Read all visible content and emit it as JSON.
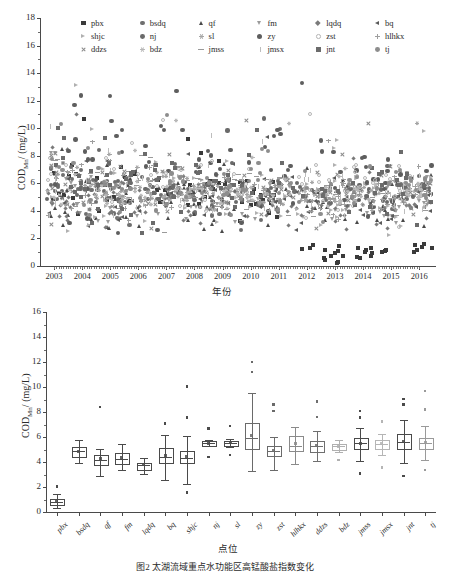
{
  "figure": {
    "caption": "图2  太湖流域重点水功能区高锰酸盐指数变化"
  },
  "chart_data": [
    {
      "id": "scatter-cod-by-year",
      "type": "scatter",
      "title": "",
      "xlabel": "年份",
      "ylabel": "CODMn/ (mg/L)",
      "ylabel_base": "COD",
      "ylabel_sub": "Mn",
      "ylabel_unit": "/ (mg/L)",
      "xlim": [
        2002.5,
        2016.6
      ],
      "ylim": [
        0,
        18
      ],
      "yticks": [
        0,
        2,
        4,
        6,
        8,
        10,
        12,
        14,
        16,
        18
      ],
      "xticks": [
        2003,
        2004,
        2005,
        2006,
        2007,
        2008,
        2009,
        2010,
        2011,
        2012,
        2013,
        2014,
        2015,
        2016
      ],
      "grid": false,
      "legend_position": "top-inside",
      "legend": [
        {
          "label": "pbx",
          "marker": "square",
          "color": "#3a3a3a",
          "size": 4.0
        },
        {
          "label": "bsdq",
          "marker": "circle",
          "color": "#6f6f6f",
          "size": 4.2
        },
        {
          "label": "qf",
          "marker": "triangle-up",
          "color": "#4a4a4a",
          "size": 4.2
        },
        {
          "label": "fm",
          "marker": "triangle-down",
          "color": "#9a9a9a",
          "size": 4.2
        },
        {
          "label": "lqdq",
          "marker": "diamond",
          "color": "#7a7a7a",
          "size": 4.0
        },
        {
          "label": "bq",
          "marker": "triangle-left",
          "color": "#5a5a5a",
          "size": 4.2
        },
        {
          "label": "shjc",
          "marker": "triangle-right",
          "color": "#b0b0b0",
          "size": 4.2
        },
        {
          "label": "nj",
          "marker": "circle",
          "color": "#6a6a6a",
          "size": 4.2
        },
        {
          "label": "sl",
          "marker": "star",
          "color": "#a5a5a5",
          "size": 4.4
        },
        {
          "label": "zy",
          "marker": "circle",
          "color": "#5e5e5e",
          "size": 4.4
        },
        {
          "label": "zst",
          "marker": "circle-open",
          "color": "#b5b5b5",
          "size": 4.0
        },
        {
          "label": "hlhkx",
          "marker": "plus",
          "color": "#9e9e9e",
          "size": 4.6
        },
        {
          "label": "ddzs",
          "marker": "cross",
          "color": "#8a8a8a",
          "size": 4.6
        },
        {
          "label": "bdz",
          "marker": "star",
          "color": "#b8b8b8",
          "size": 4.2
        },
        {
          "label": "jmss",
          "marker": "hline",
          "color": "#9a9a9a",
          "size": 5.0
        },
        {
          "label": "jmsx",
          "marker": "vline",
          "color": "#bdbdbd",
          "size": 5.0
        },
        {
          "label": "jnt",
          "marker": "square",
          "color": "#6b6b6b",
          "size": 4.0
        },
        {
          "label": "tj",
          "marker": "circle",
          "color": "#8d8d8d",
          "size": 4.2
        }
      ],
      "description": "Dense band of COD_Mn values between 4 and 7 mg/L across 2003-2016; sparse high outliers to 12 mg/L in 2003-2005; a distinct low cluster near 0.5-1.5 mg/L for site pbx from 2012 onward."
    },
    {
      "id": "boxplot-cod-by-site",
      "type": "box",
      "title": "",
      "xlabel": "点位",
      "ylabel": "CODMn/ (mg/L)",
      "ylabel_base": "COD",
      "ylabel_sub": "Mn",
      "ylabel_unit": "/ (mg/L)",
      "ylim": [
        0,
        16
      ],
      "yticks": [
        0,
        2,
        4,
        6,
        8,
        10,
        12,
        14,
        16
      ],
      "grid": false,
      "categories": [
        "pbx",
        "bsdq",
        "qf",
        "fm",
        "lqdq",
        "bq",
        "shjc",
        "nj",
        "sl",
        "zy",
        "zst",
        "hlhkx",
        "ddzs",
        "bdz",
        "jmss",
        "jmsx",
        "jnt",
        "tj"
      ],
      "boxes": [
        {
          "category": "pbx",
          "whisker_low": 0.3,
          "q1": 0.62,
          "median": 0.82,
          "q3": 1.05,
          "whisker_high": 1.45,
          "mean": 0.85,
          "outliers": [
            2.05
          ],
          "color": "#4a4a4a"
        },
        {
          "category": "bsdq",
          "whisker_low": 3.95,
          "q1": 4.45,
          "median": 4.85,
          "q3": 5.2,
          "whisker_high": 5.75,
          "mean": 4.85,
          "outliers": [],
          "color": "#4a4a4a"
        },
        {
          "category": "qf",
          "whisker_low": 2.9,
          "q1": 3.85,
          "median": 4.2,
          "q3": 4.6,
          "whisker_high": 5.05,
          "mean": 4.25,
          "outliers": [
            8.4
          ],
          "color": "#4a4a4a"
        },
        {
          "category": "fm",
          "whisker_low": 3.4,
          "q1": 3.95,
          "median": 4.25,
          "q3": 4.7,
          "whisker_high": 5.45,
          "mean": 4.35,
          "outliers": [],
          "color": "#4a4a4a"
        },
        {
          "category": "lqdq",
          "whisker_low": 3.05,
          "q1": 3.45,
          "median": 3.75,
          "q3": 3.95,
          "whisker_high": 4.35,
          "mean": 3.78,
          "outliers": [],
          "color": "#4a4a4a"
        },
        {
          "category": "bq",
          "whisker_low": 2.55,
          "q1": 4.0,
          "median": 4.4,
          "q3": 5.1,
          "whisker_high": 6.2,
          "mean": 4.55,
          "outliers": [
            7.1
          ],
          "color": "#4a4a4a"
        },
        {
          "category": "shjc",
          "whisker_low": 2.25,
          "q1": 4.0,
          "median": 4.3,
          "q3": 4.85,
          "whisker_high": 6.05,
          "mean": 4.45,
          "outliers": [
            1.55,
            7.55,
            10.05
          ],
          "color": "#4a4a4a"
        },
        {
          "category": "nj",
          "whisker_low": 5.25,
          "q1": 5.4,
          "median": 5.5,
          "q3": 5.65,
          "whisker_high": 5.8,
          "mean": 5.52,
          "outliers": [
            4.4,
            6.7
          ],
          "color": "#4a4a4a"
        },
        {
          "category": "sl",
          "whisker_low": 5.2,
          "q1": 5.4,
          "median": 5.52,
          "q3": 5.68,
          "whisker_high": 5.85,
          "mean": 5.54,
          "outliers": [
            4.55,
            6.9
          ],
          "color": "#4a4a4a"
        },
        {
          "category": "zy",
          "whisker_low": 3.3,
          "q1": 5.1,
          "median": 5.95,
          "q3": 7.1,
          "whisker_high": 9.5,
          "mean": 6.1,
          "outliers": [
            11.2,
            12.0
          ],
          "color": "#6a6a6a"
        },
        {
          "category": "zst",
          "whisker_low": 3.35,
          "q1": 4.55,
          "median": 4.9,
          "q3": 5.25,
          "whisker_high": 6.0,
          "mean": 4.95,
          "outliers": [
            8.1,
            8.6
          ],
          "color": "#6a6a6a"
        },
        {
          "category": "hlhkx",
          "whisker_low": 3.85,
          "q1": 4.95,
          "median": 5.25,
          "q3": 6.05,
          "whisker_high": 6.8,
          "mean": 5.45,
          "outliers": [],
          "color": "#8a8a8a"
        },
        {
          "category": "ddzs",
          "whisker_low": 4.05,
          "q1": 4.9,
          "median": 5.25,
          "q3": 5.65,
          "whisker_high": 6.45,
          "mean": 5.3,
          "outliers": [
            7.6,
            8.85
          ],
          "color": "#6f6f6f"
        },
        {
          "category": "bdz",
          "whisker_low": 4.8,
          "q1": 5.05,
          "median": 5.25,
          "q3": 5.45,
          "whisker_high": 5.75,
          "mean": 5.28,
          "outliers": [
            4.15
          ],
          "color": "#b0b0b0"
        },
        {
          "category": "jmss",
          "whisker_low": 4.1,
          "q1": 5.1,
          "median": 5.5,
          "q3": 5.9,
          "whisker_high": 6.75,
          "mean": 5.52,
          "outliers": [
            3.1,
            7.55,
            8.1
          ],
          "color": "#4a4a4a"
        },
        {
          "category": "jmsx",
          "whisker_low": 4.55,
          "q1": 5.15,
          "median": 5.45,
          "q3": 5.8,
          "whisker_high": 6.25,
          "mean": 5.48,
          "outliers": [
            3.55,
            7.25
          ],
          "color": "#b5b5b5"
        },
        {
          "category": "jnt",
          "whisker_low": 3.9,
          "q1": 5.1,
          "median": 5.6,
          "q3": 6.25,
          "whisker_high": 7.4,
          "mean": 5.65,
          "outliers": [
            2.9,
            8.6,
            9.05
          ],
          "color": "#4a4a4a"
        },
        {
          "category": "tj",
          "whisker_low": 4.2,
          "q1": 5.15,
          "median": 5.5,
          "q3": 5.95,
          "whisker_high": 6.9,
          "mean": 5.55,
          "outliers": [
            3.35,
            8.2,
            9.7
          ],
          "color": "#9a9a9a"
        }
      ]
    }
  ]
}
